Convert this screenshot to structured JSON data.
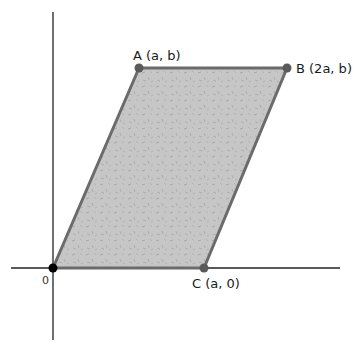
{
  "diagram": {
    "type": "parallelogram-on-axes",
    "colors": {
      "axis": "#222222",
      "fill": "#c4c4c4",
      "edge": "#6b6b6b",
      "vertex": "#5a5a5a",
      "origin": "#000000"
    },
    "origin_label": "0",
    "vertices": [
      {
        "id": "A",
        "label": "A (a, b)",
        "x": 139,
        "y": 68
      },
      {
        "id": "B",
        "label": "B (2a, b)",
        "x": 287,
        "y": 68
      },
      {
        "id": "C",
        "label": "C (a, 0)",
        "x": 204,
        "y": 268
      },
      {
        "id": "O",
        "label": "0",
        "x": 53,
        "y": 268
      }
    ]
  }
}
